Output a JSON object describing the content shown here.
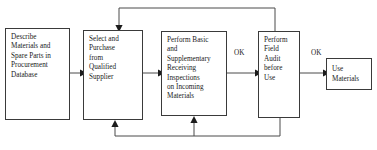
{
  "diagram": {
    "type": "flowchart",
    "orientation": "left-to-right",
    "background_color": "#ffffff",
    "box_border_color": "#3a3a3a",
    "connector_color": "#4a4a4a",
    "text_color": "#1a1a1a"
  },
  "nodes": [
    {
      "id": "describe-materials",
      "label": "Describe\nMaterials and\nSpare Parts in\nProcurement\nDatabase",
      "shape": "rectangle",
      "x": 5,
      "y": 28,
      "width": 65,
      "height": 92
    },
    {
      "id": "select-purchase",
      "label": "Select and\nPurchase\nfrom\nQualified\nSupplier",
      "shape": "rectangle",
      "x": 83,
      "y": 30,
      "width": 60,
      "height": 90
    },
    {
      "id": "receiving-inspections",
      "label": "Perform Basic\nand\nSupplementary\nReceiving\nInspections\non Incoming\nMaterials",
      "shape": "rectangle",
      "x": 161,
      "y": 31,
      "width": 66,
      "height": 85
    },
    {
      "id": "field-audit",
      "label": "Perform\nField\nAudit\nbefore\nUse",
      "shape": "rectangle",
      "x": 258,
      "y": 31,
      "width": 42,
      "height": 87
    },
    {
      "id": "use-materials",
      "label": "Use\nMaterials",
      "shape": "rectangle",
      "x": 326,
      "y": 58,
      "width": 46,
      "height": 32
    }
  ],
  "edge_labels": [
    {
      "id": "ok-inspection-to-audit",
      "text": "OK",
      "x": 234,
      "y": 49
    },
    {
      "id": "ok-audit-to-use",
      "text": "OK",
      "x": 311,
      "y": 49
    }
  ],
  "connectors": [
    {
      "id": "describe-to-select",
      "from": "describe-materials",
      "to": "select-purchase",
      "kind": "straight-arrow",
      "direction": "right"
    },
    {
      "id": "select-to-inspections",
      "from": "select-purchase",
      "to": "receiving-inspections",
      "kind": "straight-arrow",
      "direction": "right"
    },
    {
      "id": "inspections-to-audit",
      "from": "receiving-inspections",
      "to": "field-audit",
      "kind": "straight-arrow",
      "direction": "right",
      "label": "OK"
    },
    {
      "id": "audit-to-use",
      "from": "field-audit",
      "to": "use-materials",
      "kind": "straight-arrow",
      "direction": "right",
      "label": "OK"
    },
    {
      "id": "audit-top-feedback-to-select",
      "from": "field-audit",
      "to": "select-purchase",
      "kind": "feedback-loop-top",
      "direction": "down-into-top"
    },
    {
      "id": "audit-bottom-feedback-to-select",
      "from": "field-audit",
      "to": "select-purchase",
      "kind": "feedback-loop-bottom",
      "direction": "up-into-bottom"
    },
    {
      "id": "audit-bottom-feedback-to-inspections",
      "from": "field-audit",
      "to": "receiving-inspections",
      "kind": "feedback-loop-bottom",
      "direction": "up-into-bottom"
    }
  ]
}
